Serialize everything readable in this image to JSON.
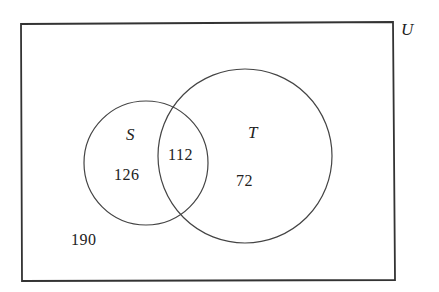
{
  "diagram": {
    "type": "venn",
    "universe": {
      "label": "U",
      "outside_count": "190"
    },
    "sets": [
      {
        "label": "S",
        "only_count": "126"
      },
      {
        "label": "T",
        "only_count": "72"
      }
    ],
    "intersection_count": "112",
    "colors": {
      "stroke": "#333333",
      "background": "#ffffff",
      "text": "#222222"
    }
  }
}
